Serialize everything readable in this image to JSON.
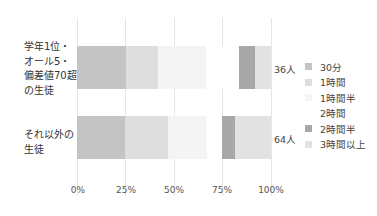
{
  "chart_data": {
    "type": "bar",
    "orientation": "horizontal",
    "stacked": true,
    "title": "",
    "xlabel": "",
    "ylabel": "",
    "xlim": [
      0,
      100
    ],
    "x_ticks": [
      "0%",
      "25%",
      "50%",
      "75%",
      "100%"
    ],
    "grid": true,
    "legend_position": "right",
    "categories": [
      "学年1位・\nオール5・\n偏差値70超\nの生徒",
      "それ以外の\n生徒"
    ],
    "totals": [
      "36人",
      "64人"
    ],
    "series": [
      {
        "name": "30分",
        "color": "#c4c4c4",
        "values": [
          25.0,
          25.0
        ]
      },
      {
        "name": "1時間",
        "color": "#dedede",
        "values": [
          16.7,
          21.9
        ]
      },
      {
        "name": "1時間半",
        "color": "#f4f4f4",
        "values": [
          25.0,
          20.3
        ]
      },
      {
        "name": "2時間",
        "color": "#ffffff",
        "values": [
          16.7,
          7.8
        ]
      },
      {
        "name": "2時間半",
        "color": "#a8a8a8",
        "values": [
          8.3,
          6.3
        ]
      },
      {
        "name": "3時間以上",
        "color": "#e2e2e2",
        "values": [
          8.3,
          18.8
        ]
      }
    ]
  }
}
